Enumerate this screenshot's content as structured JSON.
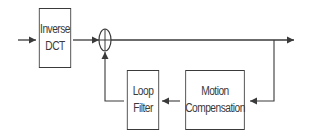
{
  "diagram": {
    "type": "block-diagram",
    "blocks": [
      {
        "id": "inverse-dct",
        "line1": "Inverse",
        "line2": "DCT"
      },
      {
        "id": "loop-filter",
        "line1": "Loop",
        "line2": "Filter"
      },
      {
        "id": "motion-compensation",
        "line1": "Motion",
        "line2": "Compensation"
      }
    ],
    "nodes": [
      {
        "id": "adder",
        "shape": "summing-junction"
      }
    ],
    "edges": [
      {
        "from": "input",
        "to": "inverse-dct"
      },
      {
        "from": "inverse-dct",
        "to": "adder"
      },
      {
        "from": "adder",
        "to": "output"
      },
      {
        "from": "output-branch",
        "to": "motion-compensation"
      },
      {
        "from": "motion-compensation",
        "to": "loop-filter"
      },
      {
        "from": "loop-filter",
        "to": "adder"
      }
    ],
    "colors": {
      "stroke": "#3a3a3a",
      "background": "#ffffff"
    }
  }
}
